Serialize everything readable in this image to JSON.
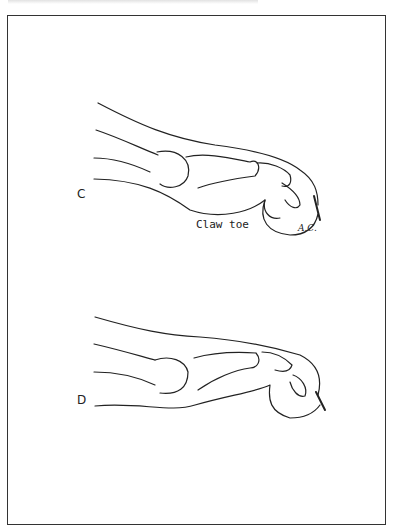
{
  "figure": {
    "panels": [
      {
        "label": "C",
        "caption": "Claw toe",
        "signature": "A.C."
      },
      {
        "label": "D"
      }
    ]
  }
}
